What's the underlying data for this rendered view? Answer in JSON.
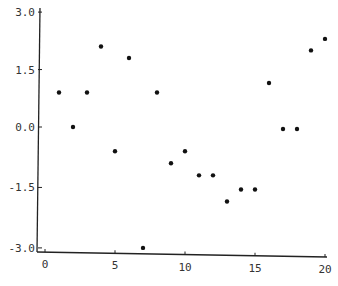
{
  "chart_data": {
    "type": "scatter",
    "title": "",
    "xlabel": "",
    "ylabel": "",
    "xlim": [
      0,
      20
    ],
    "ylim": [
      -3.0,
      3.0
    ],
    "x_ticks": [
      "0",
      "5",
      "10",
      "15",
      "20"
    ],
    "y_ticks": [
      "3.0",
      "1.5",
      "0.0",
      "-1.5",
      "-3.0"
    ],
    "grid": false,
    "legend": null,
    "series": [
      {
        "name": "points",
        "color": "#111111",
        "x": [
          1,
          2,
          3,
          4,
          5,
          6,
          7,
          8,
          9,
          10,
          11,
          12,
          13,
          14,
          15,
          16,
          17,
          18,
          19,
          20
        ],
        "y": [
          0.9,
          0.0,
          0.9,
          2.1,
          -0.6,
          1.8,
          -3.0,
          0.9,
          -0.9,
          -0.6,
          -1.2,
          -1.2,
          -1.85,
          -1.55,
          -1.55,
          1.15,
          -0.05,
          -0.05,
          2.0,
          2.3
        ]
      }
    ]
  }
}
